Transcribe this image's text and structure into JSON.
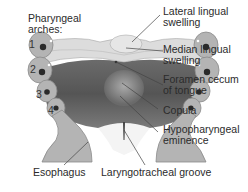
{
  "figure": {
    "arch_heading": [
      "Pharyngeal",
      "arches:"
    ],
    "arch_numbers": [
      "1",
      "2",
      "3",
      "4"
    ],
    "labels": {
      "lateral_lingual_swelling": [
        "Lateral lingual",
        "swelling"
      ],
      "median_lingual_swelling": [
        "Median lingual",
        "swelling"
      ],
      "foramen_cecum": [
        "Foramen cecum",
        "of tongue"
      ],
      "copula": [
        "Copula"
      ],
      "hypopharyngeal_eminence": [
        "Hypopharyngeal",
        "eminence"
      ],
      "esophagus": [
        "Esophagus"
      ],
      "laryngotracheal_groove": [
        "Laryngotracheal groove"
      ]
    },
    "colors": {
      "arch_tissue": "#b4b4b4",
      "arch_outline": "#8a8a8a",
      "lingual_swelling": "#dcdcdc",
      "dark_floor": "#5a5a5a",
      "mid_floor": "#8c8c8c",
      "leader_line": "#444444"
    }
  }
}
